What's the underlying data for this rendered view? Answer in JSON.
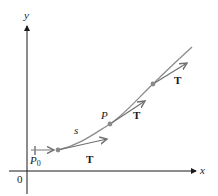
{
  "diagram": {
    "axes": {
      "x_label": "x",
      "y_label": "y",
      "origin_label": "0"
    },
    "curve": {
      "name": "space curve",
      "arc_length_label": "s"
    },
    "points": {
      "start": {
        "label": "P",
        "subscript": "0"
      },
      "current": {
        "label": "P"
      }
    },
    "tangent_vectors": [
      {
        "label": "T"
      },
      {
        "label": "T"
      },
      {
        "label": "T"
      }
    ],
    "colors": {
      "axis": "#1a1a1a",
      "curve": "#8c8c8c",
      "vector": "#707070",
      "point": "#8a8a8a",
      "text": "#1a1a1a"
    }
  }
}
